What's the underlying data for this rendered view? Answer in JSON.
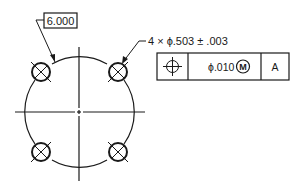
{
  "drawing": {
    "basic_dimension": "6.000",
    "hole_callout": "4 × ϕ.503 ± .003",
    "feature_control_frame": {
      "symbol": "position",
      "tolerance": "ϕ.010",
      "modifier": "M",
      "datum": "A"
    },
    "hole_count": 4,
    "colors": {
      "line": "#1a1a1a",
      "background": "#ffffff"
    }
  }
}
